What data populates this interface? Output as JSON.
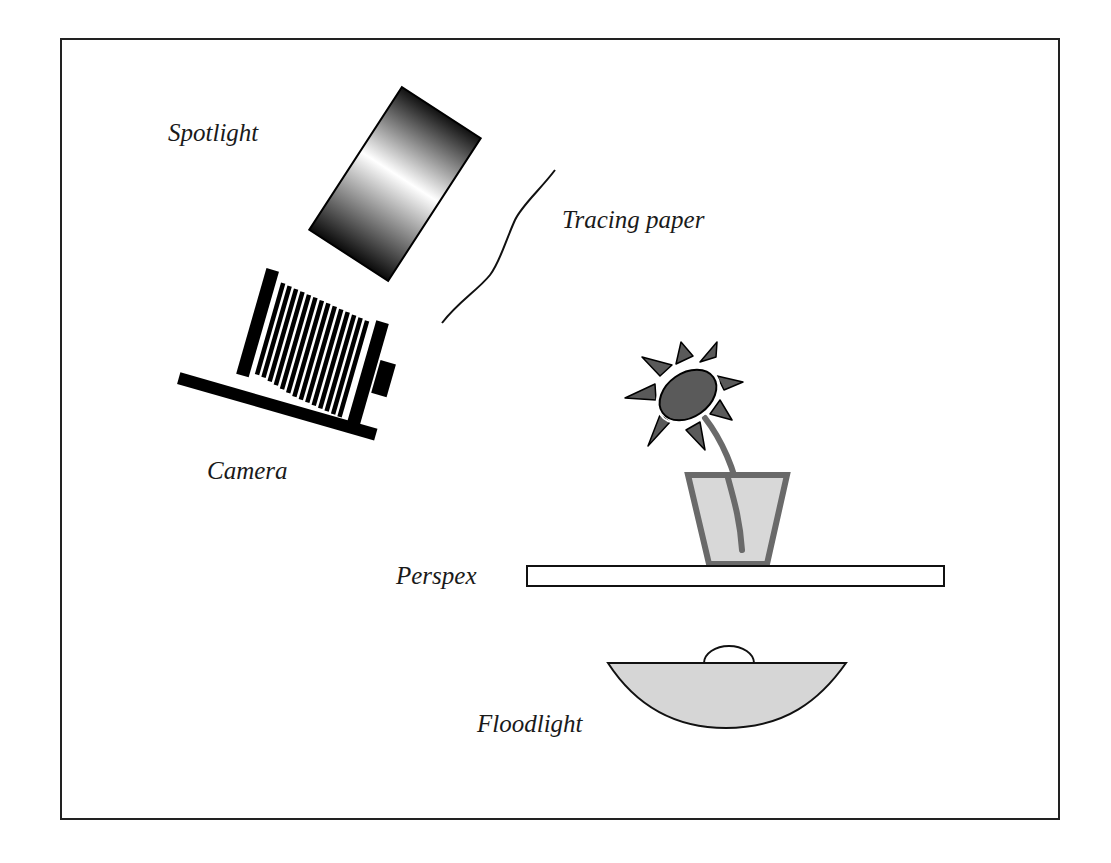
{
  "diagram": {
    "type": "photographic lighting setup",
    "labels": {
      "spotlight": "Spotlight",
      "tracing_paper": "Tracing paper",
      "camera": "Camera",
      "perspex": "Perspex",
      "floodlight": "Floodlight"
    },
    "components": [
      {
        "id": "spotlight",
        "shape": "cylindrical lamp with gradient shading",
        "label": "Spotlight"
      },
      {
        "id": "tracing-paper",
        "shape": "wavy diffuser line",
        "label": "Tracing paper"
      },
      {
        "id": "camera",
        "shape": "bellows camera on tilted base",
        "label": "Camera"
      },
      {
        "id": "flower-subject",
        "shape": "flower in tapered vase",
        "label": ""
      },
      {
        "id": "perspex",
        "shape": "horizontal sheet",
        "label": "Perspex"
      },
      {
        "id": "floodlight",
        "shape": "bowl reflector with bulb dome",
        "label": "Floodlight"
      }
    ],
    "colors": {
      "frame": "#222222",
      "ink": "#111111",
      "flower_fill": "#5a5a5a",
      "vase_outline": "#6a6a6a",
      "vase_fill": "#d8d8d8",
      "floodlight_fill": "#d6d6d6",
      "background": "#ffffff"
    }
  }
}
